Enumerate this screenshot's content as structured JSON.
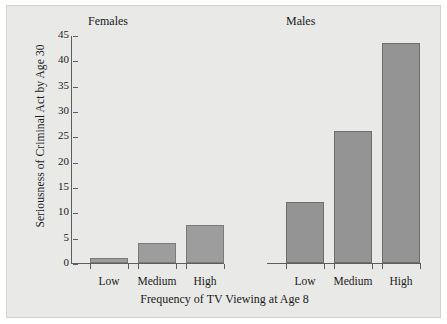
{
  "chart_data": {
    "type": "bar",
    "title": "",
    "xlabel": "Frequency of TV Viewing at Age 8",
    "ylabel": "Seriousness of Criminal Act by Age 30",
    "categories": [
      "Low",
      "Medium",
      "High"
    ],
    "ylim": [
      0,
      45
    ],
    "yticks": [
      0,
      5,
      10,
      15,
      20,
      25,
      30,
      35,
      40,
      45
    ],
    "ytick_labels": [
      "0",
      "5",
      "10",
      "15",
      "20",
      "25",
      "30",
      "35",
      "40",
      "45"
    ],
    "grid": false,
    "legend": "none",
    "panels": [
      {
        "name": "Females",
        "values": [
          1,
          4,
          7.5
        ]
      },
      {
        "name": "Males",
        "values": [
          12,
          26,
          43.5
        ]
      }
    ],
    "series": [
      {
        "name": "Females",
        "values": [
          1,
          4,
          7.5
        ]
      },
      {
        "name": "Males",
        "values": [
          12,
          26,
          43.5
        ]
      }
    ],
    "colors": {
      "background": "#e9e9e7",
      "bar_females": "#9d9d9d",
      "bar_males": "#949494",
      "axis": "#5d5d5d",
      "text": "#1a1a1a"
    }
  }
}
